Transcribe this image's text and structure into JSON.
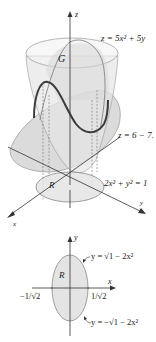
{
  "figure_3d": {
    "axis_labels": {
      "z": "z",
      "x": "x",
      "y": "y"
    },
    "surface_top_label": "z = 5x² + 5y",
    "surface_bottom_label": "z = 6 − 7.",
    "solid_label": "G",
    "region_label": "R",
    "region_boundary_label": "2x² + y² = 1"
  },
  "figure_2d": {
    "axis_labels": {
      "x": "x",
      "y": "y"
    },
    "region_label": "R",
    "upper_curve_label": "y = √1 − 2x²",
    "lower_curve_label": "y = −√1 − 2x²",
    "left_intercept_label": "−1/√2",
    "right_intercept_label": "1/√2"
  },
  "colors": {
    "line": "#333333",
    "surface_fill": "#d8d8d8",
    "region_fill": "#e4e4e4",
    "curve_dark": "#3a3a3a"
  }
}
